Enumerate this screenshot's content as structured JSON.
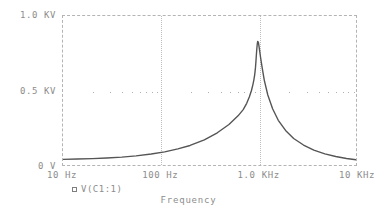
{
  "chart_data": {
    "type": "line",
    "title": "",
    "xlabel": "Frequency",
    "ylabel": "",
    "xscale": "log",
    "yscale": "linear",
    "xlim": [
      10,
      10000
    ],
    "ylim": [
      0,
      1000
    ],
    "grid": true,
    "legend_position": "below-axis",
    "xtick_labels": [
      "10 Hz",
      "100 Hz",
      "1.0 KHz",
      "10 KHz"
    ],
    "xtick_values": [
      10,
      100,
      1000,
      10000
    ],
    "ytick_labels": [
      "1.0 KV",
      "0.5 KV",
      "0 V"
    ],
    "ytick_values": [
      1000,
      500,
      0
    ],
    "series": [
      {
        "name": "V(C1:1)",
        "marker": "open-square",
        "color": "#555555",
        "x": [
          10,
          14,
          20,
          28,
          40,
          56,
          80,
          110,
          150,
          200,
          280,
          380,
          500,
          620,
          700,
          760,
          810,
          850,
          880,
          900,
          915,
          925,
          935,
          945,
          955,
          965,
          975,
          985,
          1000,
          1020,
          1050,
          1090,
          1150,
          1250,
          1400,
          1600,
          1900,
          2300,
          2900,
          3700,
          4800,
          6200,
          8000,
          10000
        ],
        "y": [
          38,
          40,
          43,
          47,
          53,
          61,
          74,
          88,
          108,
          131,
          169,
          216,
          272,
          330,
          372,
          414,
          458,
          500,
          540,
          572,
          600,
          625,
          655,
          695,
          740,
          780,
          812,
          830,
          825,
          790,
          730,
          660,
          570,
          470,
          378,
          300,
          232,
          178,
          134,
          100,
          75,
          57,
          44,
          35
        ]
      }
    ],
    "annotations": []
  },
  "axis": {
    "x_title": "Frequency"
  },
  "legend": {
    "entries": [
      {
        "marker": "open-square-icon",
        "label": "V(C1:1)"
      }
    ]
  },
  "ticks": {
    "y": [
      {
        "label": "1.0 KV",
        "value": 1000
      },
      {
        "label": "0.5 KV",
        "value": 500
      },
      {
        "label": "0 V",
        "value": 0
      }
    ],
    "x": [
      {
        "label": "10 Hz",
        "value": 10
      },
      {
        "label": "100 Hz",
        "value": 100
      },
      {
        "label": "1.0 KHz",
        "value": 1000
      },
      {
        "label": "10 KHz",
        "value": 10000
      }
    ]
  },
  "style": {
    "trace_color": "#555555",
    "grid_color": "#b8b8b8",
    "frame_color": "#b4b4b4",
    "text_color": "#8d8d8d",
    "background": "#ffffff"
  }
}
